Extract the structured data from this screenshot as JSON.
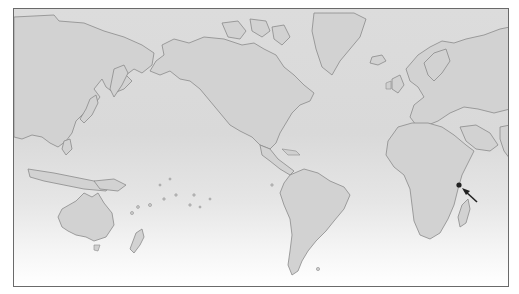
{
  "map": {
    "projection": "Mercator, Pacific-centered",
    "style": "grayscale outline world map",
    "marker": {
      "type": "dot-with-arrow",
      "location_description": "Indian Ocean, east of Madagascar",
      "dot_position_px": [
        458,
        184
      ],
      "arrow_from_px": [
        476,
        201
      ],
      "arrow_to_px": [
        462,
        188
      ],
      "color": "#222222"
    },
    "colors": {
      "land": "#d2d2d2",
      "ocean_top": "#dcdcdc",
      "ocean_bottom": "#ffffff",
      "coastline": "#8a8a8a",
      "frame": "#6a6a6a"
    }
  }
}
